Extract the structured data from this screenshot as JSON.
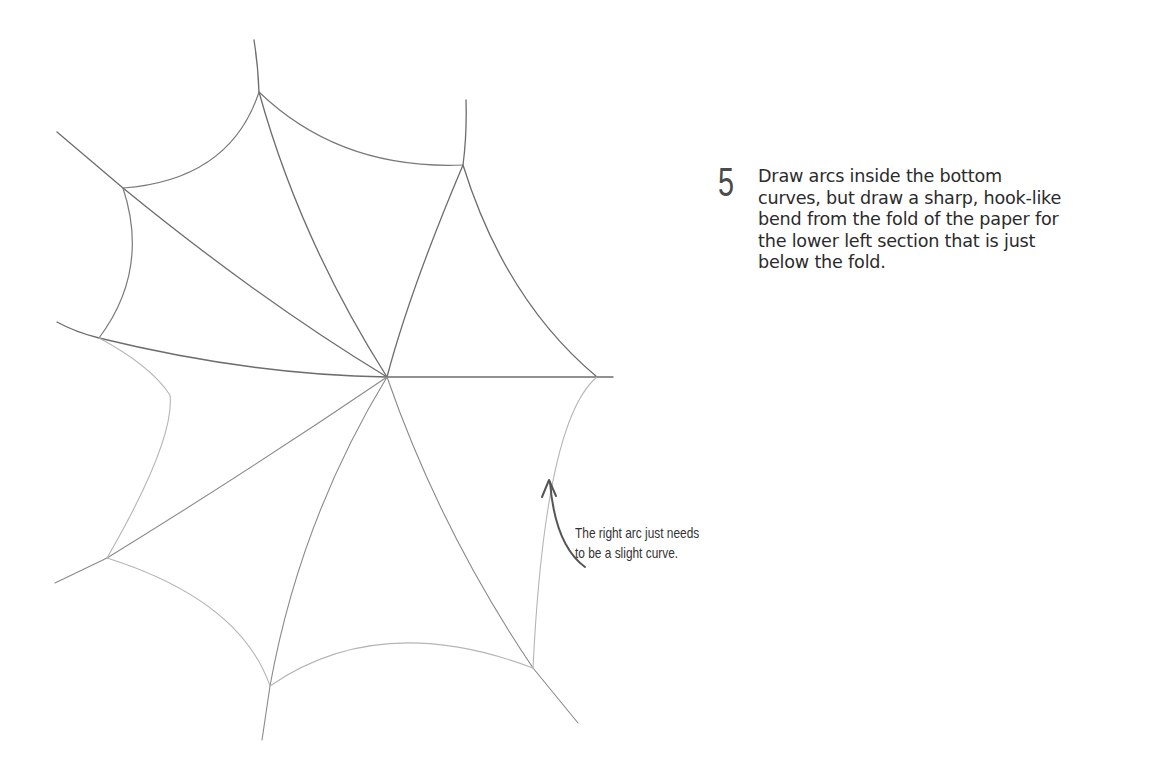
{
  "step": {
    "number": "5",
    "instruction": "Draw arcs inside the bottom curves, but draw a sharp, hook-like bend from the fold of the paper for the lower left section that is just below the fold."
  },
  "annotation": {
    "line1": "The right arc just needs",
    "line2": "to be a slight curve."
  },
  "colors": {
    "pencil_dark": "#6a6a6a",
    "pencil_light": "#b8b8b8",
    "arrow": "#555555",
    "text": "#2b2b2b"
  }
}
